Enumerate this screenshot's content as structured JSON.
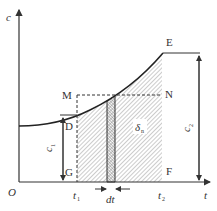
{
  "diagram": {
    "axes": {
      "y_label": "c",
      "x_label": "t",
      "origin_label": "O"
    },
    "points": {
      "E": "E",
      "M": "M",
      "N": "N",
      "D": "D",
      "G": "G",
      "F": "F"
    },
    "ticks": {
      "t1": "t",
      "t1_sub": "1",
      "t2": "t",
      "t2_sub": "2"
    },
    "annotations": {
      "c1": "c",
      "c1_sub": "1",
      "c2": "c",
      "c2_sub": "2",
      "delta": "δ",
      "delta_sub": "n",
      "dt": "dt"
    },
    "colors": {
      "line": "#333333",
      "hatch": "#888888",
      "strip": "#bbbbbb"
    }
  }
}
